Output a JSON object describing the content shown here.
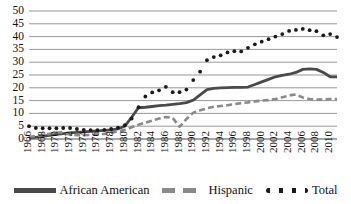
{
  "chart_data": {
    "type": "line",
    "title": "",
    "subtitle": "",
    "xlabel": "",
    "ylabel": "",
    "ylim": [
      0,
      50
    ],
    "ytick_step": 5,
    "yticks": [
      "0",
      "5",
      "10",
      "15",
      "20",
      "25",
      "30",
      "35",
      "40",
      "45",
      "50"
    ],
    "grid": true,
    "grid_axis": "y",
    "legend_position": "bottom",
    "xlim": [
      1966,
      2011
    ],
    "x_tick_labels": [
      "1966",
      "1968",
      "1970",
      "1972",
      "1974",
      "1976",
      "1978",
      "1980",
      "1982",
      "1984",
      "1986",
      "1988",
      "1990",
      "1992",
      "1994",
      "1996",
      "1998",
      "2000",
      "2002",
      "2004",
      "2006",
      "2008",
      "2010"
    ],
    "x": [
      1966,
      1967,
      1968,
      1969,
      1970,
      1971,
      1972,
      1973,
      1974,
      1975,
      1976,
      1977,
      1978,
      1979,
      1980,
      1981,
      1982,
      1983,
      1984,
      1985,
      1986,
      1987,
      1988,
      1989,
      1990,
      1991,
      1992,
      1993,
      1994,
      1995,
      1996,
      1997,
      1998,
      1999,
      2000,
      2001,
      2002,
      2003,
      2004,
      2005,
      2006,
      2007,
      2008,
      2009,
      2010,
      2011
    ],
    "series": [
      {
        "name": "African American",
        "style": "solid",
        "color": "#4a4a4a",
        "values": [
          0.2,
          0.6,
          1.0,
          1.4,
          1.8,
          2.1,
          2.4,
          2.6,
          2.8,
          3.0,
          3.2,
          3.4,
          3.6,
          4.0,
          5.0,
          8.5,
          12.2,
          12.4,
          12.7,
          13.0,
          13.2,
          13.5,
          13.8,
          14.2,
          15.2,
          17.2,
          19.3,
          19.8,
          20.0,
          20.1,
          20.2,
          20.2,
          20.3,
          21.3,
          22.3,
          23.3,
          24.3,
          24.9,
          25.3,
          26.0,
          27.2,
          27.4,
          27.2,
          26.0,
          24.3,
          24.3
        ]
      },
      {
        "name": "Hispanic",
        "style": "dashed",
        "color": "#8a8a8a",
        "values": [
          0.8,
          1.2,
          1.6,
          2.0,
          2.4,
          2.6,
          1.6,
          1.5,
          1.5,
          1.6,
          1.8,
          2.0,
          2.4,
          3.0,
          3.6,
          4.6,
          5.6,
          6.4,
          7.2,
          8.0,
          8.6,
          8.2,
          4.8,
          7.8,
          10.3,
          11.2,
          12.0,
          12.6,
          12.9,
          13.2,
          13.6,
          14.0,
          14.3,
          14.7,
          15.0,
          15.2,
          15.6,
          16.3,
          17.0,
          17.4,
          16.2,
          15.6,
          15.4,
          15.4,
          15.6,
          15.6
        ]
      },
      {
        "name": "Total",
        "style": "dotted",
        "color": "#1a1a1a",
        "values": [
          5.0,
          4.3,
          4.2,
          4.2,
          4.2,
          4.3,
          4.3,
          3.9,
          3.6,
          3.5,
          3.5,
          3.6,
          3.9,
          4.4,
          5.4,
          8.0,
          12.4,
          16.6,
          18.2,
          19.0,
          20.4,
          18.3,
          18.3,
          19.3,
          23.0,
          26.3,
          30.8,
          32.0,
          32.7,
          33.8,
          34.3,
          34.2,
          35.6,
          37.0,
          38.0,
          39.0,
          40.0,
          41.0,
          42.2,
          42.6,
          43.0,
          42.5,
          42.1,
          40.5,
          41.0,
          39.8
        ]
      }
    ],
    "legend": [
      "African American",
      "Hispanic",
      "Total"
    ]
  },
  "legend_items": [
    {
      "label": "African American",
      "style": "solid"
    },
    {
      "label": "Hispanic",
      "style": "dashed"
    },
    {
      "label": "Total",
      "style": "dotted"
    }
  ]
}
